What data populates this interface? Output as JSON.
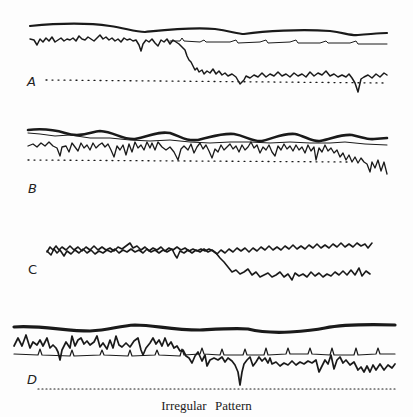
{
  "figure": {
    "caption": "Irregular Pattern",
    "ink_color": "#1a1a1a",
    "background_color": "#fdfdfd"
  },
  "panels": [
    {
      "label": "A",
      "description": "Thick slow wave on top, thin regular baseline with spikes, noisy trace that drops to a lower level around the middle, dotted reference line"
    },
    {
      "label": "B",
      "description": "Thick sinusoidal wave interleaved with thin line, irregular spiky trace above dotted reference, falling at right end"
    },
    {
      "label": "C",
      "description": "Two noisy traces overlapping then diverging; lower trace drops around two-thirds point"
    },
    {
      "label": "D",
      "description": "Thick slow wave on top, irregular high-amplitude trace, thin baseline with periodic spikes, dotted reference line"
    }
  ]
}
